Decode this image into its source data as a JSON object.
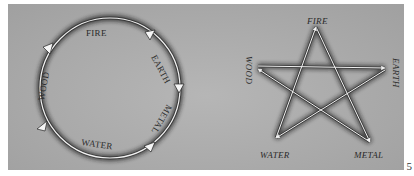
{
  "figure": {
    "page_number": "5",
    "background_color": "#aaaaaa",
    "line_color": "#f2f2f2",
    "shadow_color": "#2a2a2a"
  },
  "generating_cycle": {
    "shape": "circle",
    "direction": "clockwise",
    "elements": [
      {
        "label": "FIRE"
      },
      {
        "label": "EARTH"
      },
      {
        "label": "METAL"
      },
      {
        "label": "WATER"
      },
      {
        "label": "WOOD"
      }
    ]
  },
  "controlling_cycle": {
    "shape": "pentagram",
    "points": [
      {
        "label": "FIRE",
        "position": "top"
      },
      {
        "label": "EARTH",
        "position": "right"
      },
      {
        "label": "METAL",
        "position": "bottom-right"
      },
      {
        "label": "WATER",
        "position": "bottom-left"
      },
      {
        "label": "WOOD",
        "position": "left"
      }
    ],
    "arrows": [
      {
        "from": "FIRE",
        "to": "METAL"
      },
      {
        "from": "METAL",
        "to": "WOOD"
      },
      {
        "from": "WOOD",
        "to": "EARTH"
      },
      {
        "from": "EARTH",
        "to": "WATER"
      },
      {
        "from": "WATER",
        "to": "FIRE"
      }
    ]
  }
}
